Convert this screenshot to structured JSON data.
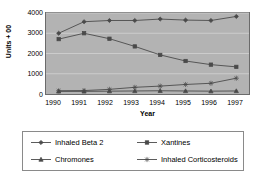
{
  "chart_data": {
    "type": "line",
    "title": "",
    "xlabel": "Year",
    "ylabel": "Units + 00",
    "categories": [
      "1990",
      "1991",
      "1992",
      "1993",
      "1994",
      "1995",
      "1996",
      "1997"
    ],
    "ylim": [
      0,
      4000
    ],
    "yticks": [
      "0",
      "1000",
      "2000",
      "3000",
      "4000"
    ],
    "grid": true,
    "legend_position": "bottom",
    "series": [
      {
        "name": "Inhaled Beta 2",
        "marker": "diamond",
        "color": "#4a4a4a",
        "values": [
          3000,
          3570,
          3630,
          3630,
          3700,
          3650,
          3630,
          3830
        ]
      },
      {
        "name": "Xantines",
        "marker": "square",
        "color": "#4a4a4a",
        "values": [
          2710,
          3000,
          2730,
          2350,
          1930,
          1630,
          1450,
          1340
        ]
      },
      {
        "name": "Chromones",
        "marker": "triangle",
        "color": "#4a4a4a",
        "values": [
          130,
          130,
          140,
          150,
          160,
          150,
          140,
          150
        ]
      },
      {
        "name": "Inhaled Corticosteroids",
        "marker": "star",
        "color": "#4a4a4a",
        "values": [
          160,
          170,
          230,
          330,
          390,
          470,
          530,
          780
        ]
      }
    ]
  },
  "legend": {
    "items": [
      {
        "label": "Inhaled Beta 2",
        "marker": "diamond"
      },
      {
        "label": "Xantines",
        "marker": "square"
      },
      {
        "label": "Chromones",
        "marker": "triangle"
      },
      {
        "label": "Inhaled Corticosteroids",
        "marker": "star"
      }
    ]
  }
}
